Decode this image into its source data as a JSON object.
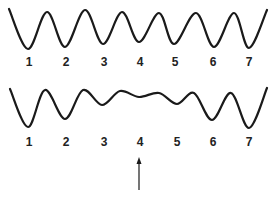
{
  "diagram": {
    "top_wave": {
      "labels": [
        "1",
        "2",
        "3",
        "4",
        "5",
        "6",
        "7"
      ],
      "label_x": [
        29,
        66,
        104,
        140,
        175,
        213,
        249
      ],
      "label_y": 66,
      "points": [
        [
          9,
          9
        ],
        [
          28,
          49
        ],
        [
          47,
          12
        ],
        [
          65,
          47
        ],
        [
          85,
          10
        ],
        [
          103,
          44
        ],
        [
          122,
          12
        ],
        [
          139,
          42
        ],
        [
          159,
          13
        ],
        [
          174,
          44
        ],
        [
          196,
          13
        ],
        [
          214,
          47
        ],
        [
          234,
          13
        ],
        [
          249,
          48
        ],
        [
          267,
          10
        ]
      ]
    },
    "bottom_wave": {
      "labels": [
        "1",
        "2",
        "3",
        "4",
        "5",
        "6",
        "7"
      ],
      "label_x": [
        29,
        66,
        104,
        140,
        177,
        213,
        249
      ],
      "label_y": 146,
      "points": [
        [
          10,
          89
        ],
        [
          28,
          127
        ],
        [
          45,
          90
        ],
        [
          65,
          119
        ],
        [
          83,
          90
        ],
        [
          102,
          105
        ],
        [
          120,
          91
        ],
        [
          139,
          97
        ],
        [
          159,
          93
        ],
        [
          177,
          104
        ],
        [
          194,
          93
        ],
        [
          212,
          120
        ],
        [
          231,
          93
        ],
        [
          249,
          128
        ],
        [
          267,
          88
        ]
      ]
    },
    "arrow": {
      "x": 139,
      "y_tip": 157,
      "y_tail": 190,
      "points_to": "4"
    },
    "stroke_color": "#1a1a1a"
  }
}
